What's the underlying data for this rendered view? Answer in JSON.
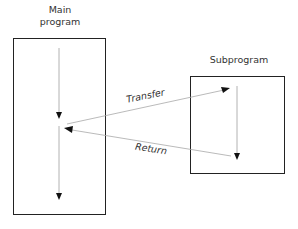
{
  "diagram": {
    "main_program": {
      "title_line1": "Main",
      "title_line2": "program"
    },
    "subprogram": {
      "title": "Subprogram"
    },
    "edges": {
      "transfer_label": "Transfer",
      "return_label": "Return"
    },
    "colors": {
      "box_border": "#222222",
      "flow_line": "#999999",
      "arrowhead": "#111111",
      "text": "#333333"
    }
  }
}
